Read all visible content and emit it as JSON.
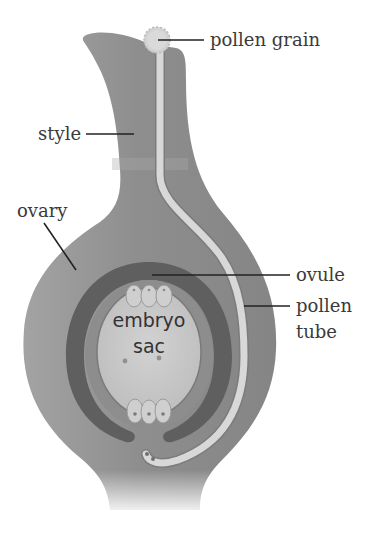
{
  "diagram": {
    "labels": {
      "pollen_grain": "pollen grain",
      "style": "style",
      "ovary": "ovary",
      "ovule": "ovule",
      "pollen_tube_line1": "pollen",
      "pollen_tube_line2": "tube",
      "embryo_sac_line1": "embryo",
      "embryo_sac_line2": "sac"
    },
    "colors": {
      "pistil": "#8f8f8f",
      "pistil_light": "#a6a6a6",
      "integument_dark": "#5e5e5e",
      "ovule_mid": "#8a8a8a",
      "embryo_sac": "#c9c9c9",
      "pollen_tube": "#d6d6d6",
      "pollen_grain": "#d0d0d0",
      "text": "#3a3a3a"
    }
  }
}
